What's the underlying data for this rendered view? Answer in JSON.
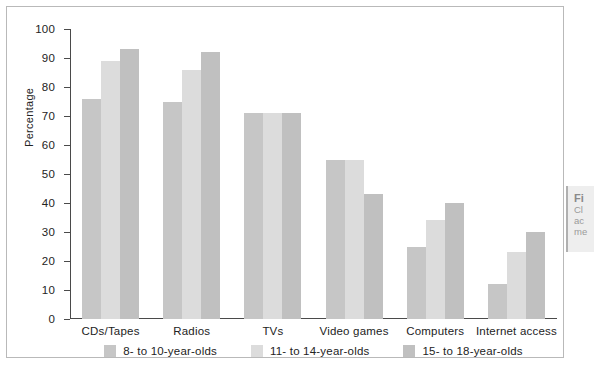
{
  "chart_data": {
    "type": "bar",
    "title": "",
    "xlabel": "",
    "ylabel": "Percentage",
    "ylim": [
      0,
      100
    ],
    "ytick_step": 10,
    "yticks": [
      100,
      90,
      80,
      70,
      60,
      50,
      40,
      30,
      20,
      10,
      0
    ],
    "grid": false,
    "legend_position": "bottom-center",
    "categories": [
      "CDs/Tapes",
      "Radios",
      "TVs",
      "Video games",
      "Computers",
      "Internet access"
    ],
    "series": [
      {
        "name": "8- to 10-year-olds",
        "color": "#c6c6c6",
        "values": [
          76,
          75,
          71,
          55,
          25,
          12
        ]
      },
      {
        "name": "11- to 14-year-olds",
        "color": "#dcdcdc",
        "values": [
          89,
          86,
          71,
          55,
          34,
          23
        ]
      },
      {
        "name": "15- to 18-year-olds",
        "color": "#c0c0c0",
        "values": [
          93,
          92,
          71,
          43,
          40,
          30
        ]
      }
    ]
  },
  "caption": {
    "title": "Fi",
    "lines": [
      "Cl",
      "ac",
      "me"
    ]
  }
}
